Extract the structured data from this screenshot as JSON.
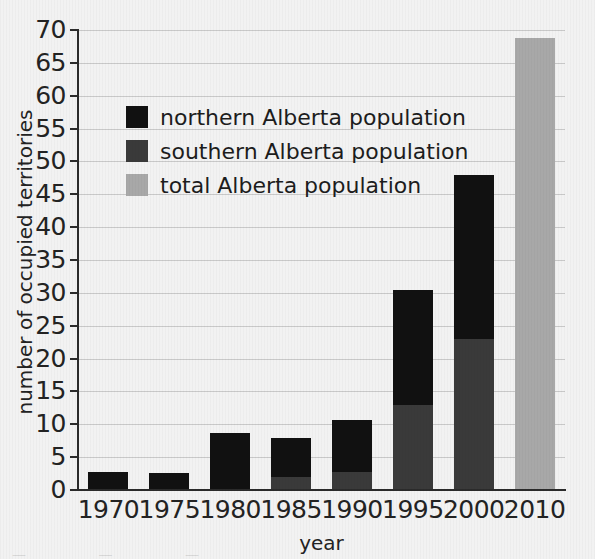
{
  "chart_data": {
    "type": "bar",
    "stacked": true,
    "title": "",
    "xlabel": "year",
    "ylabel": "number of occupied territories",
    "categories": [
      "1970",
      "1975",
      "1980",
      "1985",
      "1990",
      "1995",
      "2000",
      "2010"
    ],
    "ylim": [
      0,
      70
    ],
    "ytick_step": 5,
    "yticks": [
      0,
      5,
      10,
      15,
      20,
      25,
      30,
      35,
      40,
      45,
      50,
      55,
      60,
      65,
      70
    ],
    "ytick_labels": [
      "0",
      "5",
      "10",
      "15",
      "20",
      "25",
      "30",
      "35",
      "40",
      "45",
      "50",
      "55",
      "60",
      "65",
      "70"
    ],
    "grid": true,
    "grid_axis": "y",
    "legend_position": "upper left",
    "series": [
      {
        "name": "northern Alberta population",
        "color": "#111111",
        "values": [
          2.7,
          2.6,
          8.7,
          5.9,
          7.9,
          17.6,
          25.0,
          0
        ]
      },
      {
        "name": "southern Alberta population",
        "color": "#3a3a3a",
        "values": [
          0,
          0,
          0,
          2.0,
          2.8,
          12.9,
          23.0,
          0
        ]
      },
      {
        "name": "total Alberta population",
        "color": "#a8a8a8",
        "values": [
          0,
          0,
          0,
          0,
          0,
          0,
          0,
          68.8
        ]
      }
    ],
    "stack_totals": [
      2.7,
      2.6,
      8.7,
      7.9,
      10.7,
      30.5,
      48.0,
      68.8
    ]
  },
  "legend": {
    "items": [
      {
        "label": "northern Alberta population",
        "color": "#111111"
      },
      {
        "label": "southern Alberta population",
        "color": "#3a3a3a"
      },
      {
        "label": "total Alberta population",
        "color": "#a8a8a8"
      }
    ]
  },
  "axes": {
    "y_title": "number of occupied territories",
    "x_title": "year"
  },
  "caption_fragment": "— — —"
}
